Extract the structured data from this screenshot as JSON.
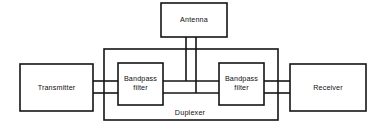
{
  "diagram": {
    "type": "block-diagram",
    "colors": {
      "line": "#141414",
      "background": "#ffffff",
      "text": "#101010"
    },
    "blocks": [
      {
        "id": "antenna",
        "label": "Antenna",
        "x": 161,
        "y": 3,
        "width": 66,
        "height": 34
      },
      {
        "id": "transmitter",
        "label": "Transmitter",
        "x": 20,
        "y": 64,
        "width": 73,
        "height": 47
      },
      {
        "id": "bandpass-filter-tx",
        "label": "Bandpass filter",
        "label_line1": "Bandpass",
        "label_line2": "filter",
        "x": 118,
        "y": 63,
        "width": 45,
        "height": 42
      },
      {
        "id": "bandpass-filter-rx",
        "label": "Bandpass filter",
        "label_line1": "Bandpass",
        "label_line2": "filter",
        "x": 219,
        "y": 63,
        "width": 45,
        "height": 42
      },
      {
        "id": "receiver",
        "label": "Receiver",
        "x": 290,
        "y": 64,
        "width": 76,
        "height": 47
      }
    ],
    "enclosure": {
      "id": "duplexer",
      "label": "Duplexer",
      "x": 104,
      "y": 49,
      "width": 174,
      "height": 71,
      "label_x": 190,
      "label_y": 113
    },
    "connections": [
      {
        "id": "antenna-to-tx-bus",
        "from": "antenna",
        "to": "bandpass-filter-tx-line",
        "path": "M 186 37 L 186 81"
      },
      {
        "id": "antenna-to-rx-bus",
        "from": "antenna",
        "to": "bandpass-filter-rx-line",
        "path": "M 196 37 L 196 93"
      },
      {
        "id": "transmitter-to-filter-upper",
        "from": "transmitter",
        "to": "bandpass-filter-tx",
        "path": "M 93 81 L 118 81"
      },
      {
        "id": "transmitter-to-filter-lower",
        "from": "transmitter",
        "to": "bandpass-filter-tx",
        "path": "M 93 93 L 118 93"
      },
      {
        "id": "filter-tx-to-mid-upper",
        "from": "bandpass-filter-tx",
        "to": "antenna-bus",
        "path": "M 163 81 L 219 81"
      },
      {
        "id": "filter-tx-to-mid-lower",
        "from": "bandpass-filter-tx",
        "to": "antenna-bus",
        "path": "M 163 93 L 219 93"
      },
      {
        "id": "filter-rx-to-receiver-upper",
        "from": "bandpass-filter-rx",
        "to": "receiver",
        "path": "M 264 81 L 290 81"
      },
      {
        "id": "filter-rx-to-receiver-lower",
        "from": "bandpass-filter-rx",
        "to": "receiver",
        "path": "M 264 93 L 290 93"
      }
    ]
  }
}
